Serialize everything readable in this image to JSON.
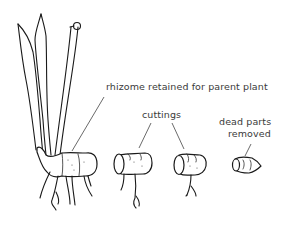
{
  "diagram": {
    "labels": {
      "rhizome": "rhizome retained for parent plant",
      "cuttings": "cuttings",
      "dead_parts_line1": "dead parts",
      "dead_parts_line2": "removed"
    },
    "parts": [
      {
        "name": "parent-plant",
        "description": "leaves and stems on rhizome with roots"
      },
      {
        "name": "cutting-1",
        "description": "rhizome section with roots"
      },
      {
        "name": "cutting-2",
        "description": "rhizome section with roots"
      },
      {
        "name": "dead-part",
        "description": "small trimmed rhizome piece"
      }
    ],
    "colors": {
      "ink": "#1a1a1a",
      "text": "#3a3a3a",
      "background": "#ffffff"
    }
  }
}
